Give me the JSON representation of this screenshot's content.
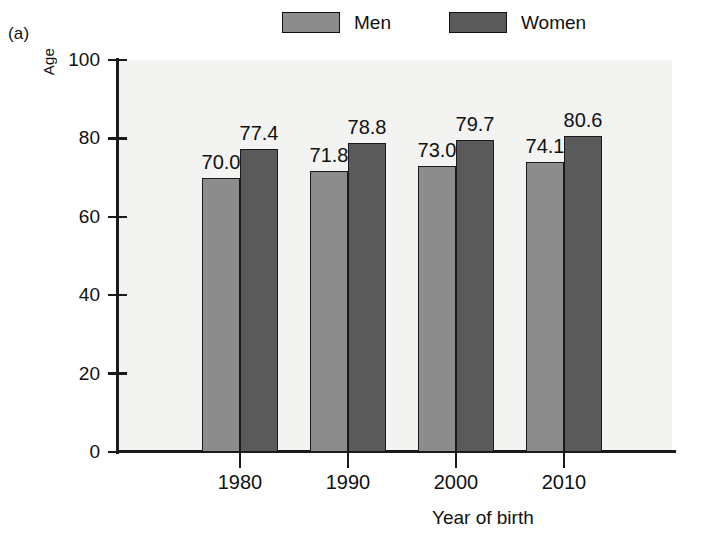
{
  "panel": {
    "label": "(a)"
  },
  "legend": {
    "entries": [
      {
        "label": "Men",
        "color": "#8c8c8c",
        "swatch_name": "legend-swatch-men"
      },
      {
        "label": "Women",
        "color": "#5a5a5a",
        "swatch_name": "legend-swatch-women"
      }
    ]
  },
  "axes": {
    "y_title": "Age",
    "x_title": "Year of birth",
    "y_ticks": [
      "0",
      "20",
      "40",
      "60",
      "80",
      "100"
    ],
    "x_ticks": [
      "1980",
      "1990",
      "2000",
      "2010"
    ]
  },
  "chart_data": {
    "type": "bar",
    "title": "",
    "subtitle": "",
    "panel_label": "(a)",
    "categories": [
      "1980",
      "1990",
      "2000",
      "2010"
    ],
    "series": [
      {
        "name": "Men",
        "color": "#8c8c8c",
        "values": [
          70.0,
          71.8,
          73.0,
          74.1
        ],
        "value_labels": [
          "70.0",
          "71.8",
          "73.0",
          "74.1"
        ]
      },
      {
        "name": "Women",
        "color": "#5a5a5a",
        "values": [
          77.4,
          78.8,
          79.7,
          80.6
        ],
        "value_labels": [
          "77.4",
          "78.8",
          "79.7",
          "80.6"
        ]
      }
    ],
    "xlabel": "Year of birth",
    "ylabel": "Age",
    "ylim": [
      0,
      100
    ],
    "ytick_values": [
      0,
      20,
      40,
      60,
      80,
      100
    ],
    "grid": false,
    "legend_position": "top",
    "bar_value_labels_shown": true
  },
  "colors": {
    "plot_background": "#f3f3f1",
    "page_background": "#ffffff",
    "axis": "#1a1a1a",
    "text": "#111111"
  }
}
